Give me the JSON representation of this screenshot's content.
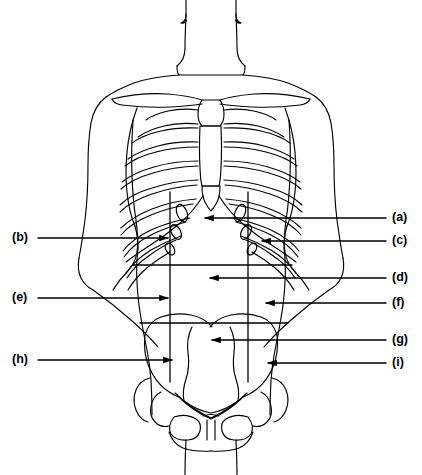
{
  "diagram": {
    "type": "anatomical-line-diagram",
    "view": "anterior",
    "line_color": "#000000",
    "background_color": "#ffffff",
    "width": 422,
    "height": 475
  },
  "labels": {
    "left": [
      {
        "id": "b",
        "text": "(b)",
        "text_x": 12,
        "text_y": 238,
        "leader_x1": 38,
        "leader_x2": 168,
        "leader_y": 238,
        "arrow": "right",
        "arrow_tip_x": 168
      },
      {
        "id": "e",
        "text": "(e)",
        "text_x": 12,
        "text_y": 298,
        "leader_x1": 38,
        "leader_x2": 168,
        "leader_y": 298,
        "arrow": "right",
        "arrow_tip_x": 168
      },
      {
        "id": "h",
        "text": "(h)",
        "text_x": 12,
        "text_y": 360,
        "leader_x1": 38,
        "leader_x2": 172,
        "leader_y": 360,
        "arrow": "right",
        "arrow_tip_x": 172
      }
    ],
    "right": [
      {
        "id": "a",
        "text": "(a)",
        "text_x": 392,
        "text_y": 218,
        "leader_x1": 386,
        "leader_x2": 205,
        "leader_y": 218,
        "arrow": "left",
        "arrow_tip_x": 205
      },
      {
        "id": "c",
        "text": "(c)",
        "text_x": 392,
        "text_y": 241,
        "leader_x1": 386,
        "leader_x2": 262,
        "leader_y": 241,
        "arrow": "left",
        "arrow_tip_x": 262
      },
      {
        "id": "d",
        "text": "(d)",
        "text_x": 392,
        "text_y": 278,
        "leader_x1": 386,
        "leader_x2": 210,
        "leader_y": 278,
        "arrow": "left",
        "arrow_tip_x": 210
      },
      {
        "id": "f",
        "text": "(f)",
        "text_x": 392,
        "text_y": 303,
        "leader_x1": 386,
        "leader_x2": 266,
        "leader_y": 303,
        "arrow": "left",
        "arrow_tip_x": 266
      },
      {
        "id": "g",
        "text": "(g)",
        "text_x": 392,
        "text_y": 340,
        "leader_x1": 386,
        "leader_x2": 212,
        "leader_y": 340,
        "arrow": "left",
        "arrow_tip_x": 212
      },
      {
        "id": "i",
        "text": "(i)",
        "text_x": 392,
        "text_y": 363,
        "leader_x1": 386,
        "leader_x2": 268,
        "leader_y": 363,
        "arrow": "left",
        "arrow_tip_x": 268
      }
    ]
  },
  "region_grid": {
    "description": "Nine-region abdominal grid",
    "vertical_lines": [
      {
        "name": "left-midclavicular",
        "x": 170,
        "y1": 192,
        "y2": 382
      },
      {
        "name": "right-midclavicular",
        "x": 248,
        "y1": 192,
        "y2": 382
      }
    ],
    "horizontal_lines": [
      {
        "name": "subcostal-plane",
        "y": 265,
        "x1": 133,
        "x2": 292
      },
      {
        "name": "intertubercular-plane",
        "y": 323,
        "x1": 140,
        "x2": 288
      }
    ]
  },
  "skeleton": {
    "parts": [
      "clavicle-left",
      "clavicle-right",
      "sternum",
      "xiphoid-process",
      "ribcage-left",
      "ribcage-right",
      "costal-margin",
      "pelvis-ilium-left",
      "pelvis-ilium-right",
      "sacrum",
      "pubic-symphysis",
      "femur-head-left",
      "femur-head-right"
    ],
    "rib_pair_count": 10
  },
  "body_outline": {
    "parts": [
      "head-base",
      "neck",
      "shoulders",
      "arm-left",
      "arm-right",
      "torso",
      "waist",
      "hips",
      "legs"
    ]
  }
}
